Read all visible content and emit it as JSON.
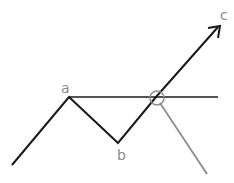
{
  "diagram": {
    "title": "",
    "labels": {
      "a": "a",
      "b": "b",
      "c": "c"
    },
    "colors": {
      "main_line": "#1a1a1a",
      "secondary_line": "#8c8c8c",
      "label": "#8a8a8a",
      "background": "#ffffff"
    },
    "points": {
      "start": [
        12,
        165
      ],
      "a": [
        69,
        97
      ],
      "b": [
        118,
        143
      ],
      "cross": [
        156,
        97
      ],
      "c": [
        220,
        26
      ],
      "horizontal_end": [
        218,
        97
      ],
      "gray_end": [
        207,
        174
      ]
    }
  }
}
